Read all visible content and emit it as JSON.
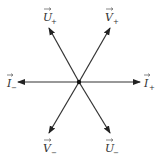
{
  "diagram": {
    "type": "vector-star",
    "center": {
      "x": 79,
      "y": 82
    },
    "stroke_color": "#333333",
    "vectors": [
      {
        "id": "U_plus",
        "letter": "U",
        "sub": "+",
        "tip": {
          "x": 49,
          "y": 28
        },
        "label_pos": {
          "x": 44,
          "y": 19
        }
      },
      {
        "id": "V_plus",
        "letter": "V",
        "sub": "+",
        "tip": {
          "x": 110,
          "y": 28
        },
        "label_pos": {
          "x": 106,
          "y": 19
        }
      },
      {
        "id": "I_minus",
        "letter": "I",
        "sub": "−",
        "tip": {
          "x": 18,
          "y": 82
        },
        "label_pos": {
          "x": 7,
          "y": 86
        }
      },
      {
        "id": "I_plus",
        "letter": "I",
        "sub": "+",
        "tip": {
          "x": 140,
          "y": 82
        },
        "label_pos": {
          "x": 144,
          "y": 86
        }
      },
      {
        "id": "V_minus",
        "letter": "V",
        "sub": "−",
        "tip": {
          "x": 49,
          "y": 133
        },
        "label_pos": {
          "x": 44,
          "y": 149
        }
      },
      {
        "id": "U_minus",
        "letter": "U",
        "sub": "−",
        "tip": {
          "x": 110,
          "y": 133
        },
        "label_pos": {
          "x": 106,
          "y": 149
        }
      }
    ]
  },
  "labels": {
    "u_plus": {
      "letter": "U",
      "sub": "+"
    },
    "v_plus": {
      "letter": "V",
      "sub": "+"
    },
    "i_minus": {
      "letter": "I",
      "sub": "−"
    },
    "i_plus": {
      "letter": "I",
      "sub": "+"
    },
    "v_minus": {
      "letter": "V",
      "sub": "−"
    },
    "u_minus": {
      "letter": "U",
      "sub": "−"
    }
  }
}
